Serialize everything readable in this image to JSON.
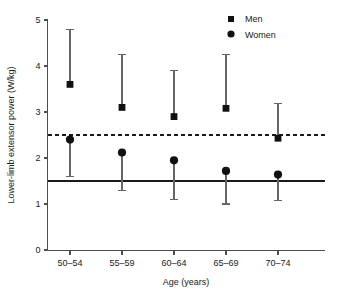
{
  "chart_data": {
    "type": "scatter",
    "title": "",
    "xlabel": "Age (years)",
    "ylabel": "Lower-limb extensor power (W/kg)",
    "categories": [
      "50–54",
      "55–59",
      "60–64",
      "65–69",
      "70–74"
    ],
    "ylim": [
      0,
      5
    ],
    "yticks": [
      0,
      1,
      2,
      3,
      4,
      5
    ],
    "ytick_labels": [
      "0",
      "1",
      "2",
      "3",
      "4",
      "5"
    ],
    "grid": false,
    "legend_position": "top-right",
    "series": [
      {
        "name": "Men",
        "marker": "square",
        "color": "#111111",
        "values": [
          3.6,
          3.1,
          2.9,
          3.08,
          2.43
        ],
        "error_upper": [
          4.8,
          4.25,
          3.9,
          4.25,
          3.18
        ]
      },
      {
        "name": "Women",
        "marker": "circle",
        "color": "#111111",
        "values": [
          2.4,
          2.12,
          1.95,
          1.72,
          1.64
        ],
        "error_lower": [
          1.6,
          1.3,
          1.1,
          1.0,
          1.08
        ]
      }
    ],
    "reference_lines": [
      {
        "name": "upper-threshold",
        "value": 2.5,
        "style": "dashed",
        "color": "#1a1a1a"
      },
      {
        "name": "lower-threshold",
        "value": 1.5,
        "style": "solid",
        "color": "#1a1a1a"
      }
    ]
  },
  "legend": {
    "men_label": "Men",
    "women_label": "Women"
  },
  "axes": {
    "x_title": "Age (years)",
    "y_title": "Lower-limb extensor power (W/kg)"
  }
}
